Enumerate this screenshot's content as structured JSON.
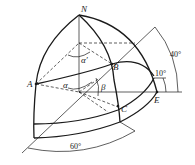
{
  "diagram": {
    "type": "spherical-geometry",
    "points": {
      "N": "N",
      "A": "A",
      "B": "B",
      "C": "C",
      "E": "E"
    },
    "angles": {
      "alpha": "α",
      "alpha_prime": "α′",
      "beta": "β"
    },
    "dimensions": {
      "angle_40": "40°",
      "angle_10": "10°",
      "angle_60": "60°"
    },
    "colors": {
      "stroke": "#1a1a1a",
      "background": "#ffffff"
    }
  }
}
